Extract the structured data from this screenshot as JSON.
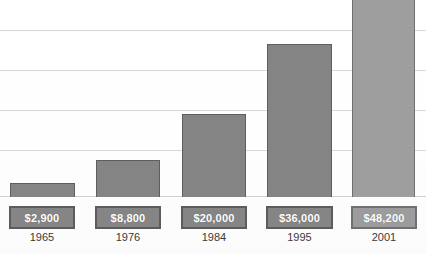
{
  "chart_data": {
    "type": "bar",
    "title": "",
    "subtitle": "",
    "xlabel": "",
    "ylabel": "",
    "categories": [
      "1965",
      "1976",
      "1984",
      "1995",
      "2001"
    ],
    "values": [
      2900,
      8800,
      20000,
      36000,
      48200
    ],
    "value_labels": [
      "$2,900",
      "$8,800",
      "$20,000",
      "$36,000",
      "$48,200"
    ],
    "ylim": [
      0,
      56000
    ],
    "grid": true,
    "gridlines_count": 5,
    "legend": "none",
    "series": [
      {
        "name": "Value",
        "values": [
          2900,
          8800,
          20000,
          36000,
          48200
        ]
      }
    ],
    "bars": [
      {
        "category": "1965",
        "value": 2900,
        "label": "$2,900",
        "x": 10,
        "width": 65,
        "top": 183,
        "height": 14,
        "shade": "dark"
      },
      {
        "category": "1976",
        "value": 8800,
        "label": "$8,800",
        "x": 96,
        "width": 64,
        "top": 160,
        "height": 37,
        "shade": "dark"
      },
      {
        "category": "1984",
        "value": 20000,
        "label": "$20,000",
        "x": 182,
        "width": 64,
        "top": 114,
        "height": 83,
        "shade": "dark"
      },
      {
        "category": "1995",
        "value": 36000,
        "label": "$36,000",
        "x": 267,
        "width": 65,
        "top": 44,
        "height": 153,
        "shade": "dark"
      },
      {
        "category": "2001",
        "value": 48200,
        "label": "$48,200",
        "x": 352,
        "width": 63,
        "top": -9,
        "height": 206,
        "shade": "light"
      }
    ],
    "gridline_y": [
      30,
      70,
      110,
      150,
      196
    ],
    "value_boxes": [
      {
        "x": 9,
        "width": 66,
        "label": "$2,900",
        "shade": "dark"
      },
      {
        "x": 95,
        "width": 66,
        "label": "$8,800",
        "shade": "dark"
      },
      {
        "x": 181,
        "width": 66,
        "label": "$20,000",
        "shade": "dark"
      },
      {
        "x": 266,
        "width": 67,
        "label": "$36,000",
        "shade": "dark"
      },
      {
        "x": 351,
        "width": 66,
        "label": "$48,200",
        "shade": "light"
      }
    ],
    "year_labels": [
      {
        "x": 9,
        "width": 66,
        "label": "1965"
      },
      {
        "x": 95,
        "width": 66,
        "label": "1976"
      },
      {
        "x": 181,
        "width": 66,
        "label": "1984"
      },
      {
        "x": 266,
        "width": 67,
        "label": "1995"
      },
      {
        "x": 351,
        "width": 66,
        "label": "2001"
      }
    ],
    "colors": {
      "bar_fill": "#848484",
      "bar_fill_light": "#9e9e9e",
      "bar_border": "#5e5e5e",
      "gridline": "#d8d8d8",
      "baseline": "#cfcfcf",
      "value_box_fill": "#858585",
      "value_box_fill_light": "#9c9c9c",
      "value_box_border": "#5c5c5c",
      "value_text": "#ffffff",
      "year_text": "#3a3a3a",
      "background": "#fdfdfd"
    }
  }
}
